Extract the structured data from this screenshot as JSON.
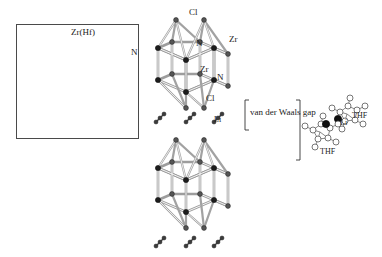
{
  "figure": {
    "type": "crystal-structure-diagram",
    "background": "#ffffff",
    "colors": {
      "atom_dark": "#111111",
      "atom_light": "#ffffff",
      "atom_outline": "#1a1a1a",
      "bond": "#b9b9b9",
      "bond_dark": "#6f6f6f",
      "frame": "#4a4a4a",
      "label": "#222222"
    }
  },
  "left_panel": {
    "name": "honeycomb-layer-view",
    "legend": {
      "metal_label": "Zr(Hf)",
      "nitrogen_label": "N"
    },
    "lattice": {
      "type": "honeycomb",
      "rows": 5,
      "cols": 4,
      "alternating_atoms": [
        "Zr(Hf)",
        "N"
      ]
    }
  },
  "upper_lattice": {
    "name": "upper-double-layer-slab",
    "labels": [
      {
        "text": "Cl",
        "role": "chloride-top"
      },
      {
        "text": "N",
        "role": "nitride-upper"
      },
      {
        "text": "Zr",
        "role": "metal-upper"
      },
      {
        "text": "Zr",
        "role": "metal-middle"
      },
      {
        "text": "N",
        "role": "nitride-middle"
      },
      {
        "text": "Cl",
        "role": "chloride-bottom"
      }
    ]
  },
  "lower_lattice": {
    "name": "lower-double-layer-slab"
  },
  "interlayer": {
    "name": "lithium-layer",
    "label": "Li",
    "dimer_rows": 3,
    "dimers_per_row": 3
  },
  "gap": {
    "label": "van der Waals gap"
  },
  "molecule_inset": {
    "name": "li-thf-complex",
    "molecules": [
      {
        "label": "THF",
        "metal_label": "Li",
        "position": "upper-right"
      },
      {
        "label": "THF",
        "metal_label": "Li",
        "position": "lower-left"
      }
    ]
  }
}
